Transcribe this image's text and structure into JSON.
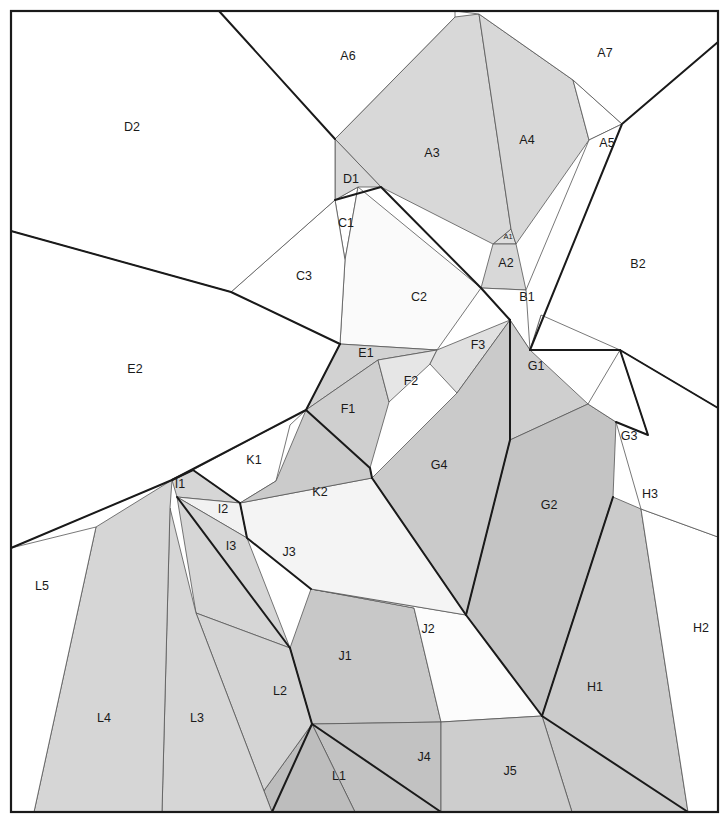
{
  "figure": {
    "kind": "polygon-region-map",
    "width": 728,
    "height": 834,
    "frame": {
      "x": 11,
      "y": 11,
      "width": 707,
      "height": 801
    },
    "background_color": "#ffffff",
    "label_color": "#1a1a1a"
  },
  "palette": {
    "white": "#ffffff",
    "near_white": "#fafafa",
    "very_light": "#f2f2f2",
    "light": "#e3e3e3",
    "light_mid": "#dadada",
    "mid": "#cfcfcf",
    "mid_dark": "#c4c4c4",
    "dark": "#bcbcbc",
    "darker": "#b4b4b4",
    "thin_stroke": "#555555",
    "thick_stroke": "#1a1a1a"
  },
  "strokes": {
    "thin_width": 0.8,
    "thick_width": 2.0
  },
  "regions": [
    {
      "id": "A1",
      "label": "A1",
      "label_x": 508,
      "label_y": 237,
      "tiny": true,
      "fill": "#dedede",
      "stroke": "#555555",
      "stroke_width": 0.8,
      "points": "493,244 511,229 516,244"
    },
    {
      "id": "A2",
      "label": "A2",
      "label_x": 506,
      "label_y": 264,
      "tiny": false,
      "fill": "#d8d8d8",
      "stroke": "#555555",
      "stroke_width": 0.8,
      "points": "493,244 516,244 526,290 481,288"
    },
    {
      "id": "A3",
      "label": "A3",
      "label_x": 432,
      "label_y": 154,
      "tiny": false,
      "fill": "#d8d8d8",
      "stroke": "#555555",
      "stroke_width": 0.8,
      "points": "335,139 455,17 479,14 511,229 493,244 381,187"
    },
    {
      "id": "A4",
      "label": "A4",
      "label_x": 527,
      "label_y": 141,
      "tiny": false,
      "fill": "#d8d8d8",
      "stroke": "#555555",
      "stroke_width": 0.8,
      "points": "479,14 573,80 589,140 516,244 511,229"
    },
    {
      "id": "A5",
      "label": "A5",
      "label_x": 607,
      "label_y": 144,
      "tiny": false,
      "fill": "#ffffff",
      "stroke": "#555555",
      "stroke_width": 0.8,
      "points": "573,80 622,124 589,140"
    },
    {
      "id": "A6",
      "label": "A6",
      "label_x": 348,
      "label_y": 57,
      "tiny": false,
      "fill": "#ffffff",
      "stroke": "#555555",
      "stroke_width": 0.8,
      "points": "219,11 455,11 455,17 335,139"
    },
    {
      "id": "A7",
      "label": "A7",
      "label_x": 605,
      "label_y": 54,
      "tiny": false,
      "fill": "#ffffff",
      "stroke": "#555555",
      "stroke_width": 0.8,
      "points": "455,11 718,11 718,42 622,124 573,80 479,14"
    },
    {
      "id": "B1",
      "label": "B1",
      "label_x": 527,
      "label_y": 298,
      "tiny": false,
      "fill": "#ffffff",
      "stroke": "#555555",
      "stroke_width": 0.8,
      "points": "526,290 481,288 510,320 530,350 541,315"
    },
    {
      "id": "B2",
      "label": "B2",
      "label_x": 638,
      "label_y": 265,
      "tiny": false,
      "fill": "#ffffff",
      "stroke": "#555555",
      "stroke_width": 0.8,
      "points": "718,42 718,408 620,350 541,315 530,350 526,290 589,140 622,124"
    },
    {
      "id": "C1",
      "label": "C1",
      "label_x": 346,
      "label_y": 224,
      "tiny": false,
      "fill": "#ffffff",
      "stroke": "#555555",
      "stroke_width": 0.8,
      "points": "335,200 358,187 345,260"
    },
    {
      "id": "C2",
      "label": "C2",
      "label_x": 419,
      "label_y": 298,
      "tiny": false,
      "fill": "#fafafa",
      "stroke": "#555555",
      "stroke_width": 0.8,
      "points": "358,187 481,288 437,350 340,344 345,260"
    },
    {
      "id": "C3",
      "label": "C3",
      "label_x": 304,
      "label_y": 277,
      "tiny": false,
      "fill": "#ffffff",
      "stroke": "#555555",
      "stroke_width": 0.8,
      "points": "335,200 345,260 340,344 231,292"
    },
    {
      "id": "D1",
      "label": "D1",
      "label_x": 351,
      "label_y": 180,
      "tiny": false,
      "fill": "#d8d8d8",
      "stroke": "#555555",
      "stroke_width": 0.8,
      "points": "335,139 381,187 358,187 335,200"
    },
    {
      "id": "D2",
      "label": "D2",
      "label_x": 132,
      "label_y": 128,
      "tiny": false,
      "fill": "#ffffff",
      "stroke": "#555555",
      "stroke_width": 0.8,
      "points": "11,11 219,11 335,139 335,200 231,292 11,231"
    },
    {
      "id": "E1",
      "label": "E1",
      "label_x": 366,
      "label_y": 354,
      "tiny": false,
      "fill": "#d2d2d2",
      "stroke": "#555555",
      "stroke_width": 0.8,
      "points": "340,344 437,350 378,360 306,410"
    },
    {
      "id": "E2",
      "label": "E2",
      "label_x": 135,
      "label_y": 370,
      "tiny": false,
      "fill": "#ffffff",
      "stroke": "#555555",
      "stroke_width": 0.8,
      "points": "11,231 231,292 340,344 306,410 172,480 11,548"
    },
    {
      "id": "F1",
      "label": "F1",
      "label_x": 348,
      "label_y": 410,
      "tiny": false,
      "fill": "#cfcfcf",
      "stroke": "#555555",
      "stroke_width": 0.8,
      "points": "306,410 378,360 389,402 370,468"
    },
    {
      "id": "F2",
      "label": "F2",
      "label_x": 411,
      "label_y": 382,
      "tiny": false,
      "fill": "#e6e6e6",
      "stroke": "#555555",
      "stroke_width": 0.8,
      "points": "378,360 437,350 430,364 389,402"
    },
    {
      "id": "F3",
      "label": "F3",
      "label_x": 478,
      "label_y": 346,
      "tiny": false,
      "fill": "#e0e0e0",
      "stroke": "#555555",
      "stroke_width": 0.8,
      "points": "437,350 510,320 457,393 430,364"
    },
    {
      "id": "G1",
      "label": "G1",
      "label_x": 536,
      "label_y": 367,
      "tiny": false,
      "fill": "#cfcfcf",
      "stroke": "#555555",
      "stroke_width": 0.8,
      "points": "510,320 530,350 588,404 510,440"
    },
    {
      "id": "G2",
      "label": "G2",
      "label_x": 549,
      "label_y": 506,
      "tiny": false,
      "fill": "#c4c4c4",
      "stroke": "#555555",
      "stroke_width": 0.8,
      "points": "510,440 588,404 616,422 613,497 542,716 466,615"
    },
    {
      "id": "G3",
      "label": "G3",
      "label_x": 629,
      "label_y": 437,
      "tiny": false,
      "fill": "#ffffff",
      "stroke": "#555555",
      "stroke_width": 0.8,
      "points": "588,404 620,350 648,435 616,422"
    },
    {
      "id": "G4",
      "label": "G4",
      "label_x": 439,
      "label_y": 466,
      "tiny": false,
      "fill": "#cacaca",
      "stroke": "#555555",
      "stroke_width": 0.8,
      "points": "457,393 510,320 510,440 466,615 372,478"
    },
    {
      "id": "H1",
      "label": "H1",
      "label_x": 595,
      "label_y": 688,
      "tiny": false,
      "fill": "#cbcbcb",
      "stroke": "#555555",
      "stroke_width": 0.8,
      "points": "613,497 641,509 688,812 572,812 542,716"
    },
    {
      "id": "H2",
      "label": "H2",
      "label_x": 701,
      "label_y": 629,
      "tiny": false,
      "fill": "#ffffff",
      "stroke": "#555555",
      "stroke_width": 0.8,
      "points": "641,509 718,537 718,812 688,812"
    },
    {
      "id": "H3",
      "label": "H3",
      "label_x": 650,
      "label_y": 495,
      "tiny": false,
      "fill": "#ffffff",
      "stroke": "#555555",
      "stroke_width": 0.8,
      "points": "620,350 718,408 718,537 641,509 616,422 648,435"
    },
    {
      "id": "I1",
      "label": "I1",
      "label_x": 180,
      "label_y": 485,
      "tiny": false,
      "fill": "#d6d6d6",
      "stroke": "#555555",
      "stroke_width": 0.8,
      "points": "172,480 193,470 240,503 177,497"
    },
    {
      "id": "I2",
      "label": "I2",
      "label_x": 223,
      "label_y": 510,
      "tiny": false,
      "fill": "#f2f2f2",
      "stroke": "#555555",
      "stroke_width": 0.8,
      "points": "177,497 240,503 247,538"
    },
    {
      "id": "I3",
      "label": "I3",
      "label_x": 231,
      "label_y": 547,
      "tiny": false,
      "fill": "#d6d6d6",
      "stroke": "#555555",
      "stroke_width": 0.8,
      "points": "177,497 247,538 290,648 196,613"
    },
    {
      "id": "J1",
      "label": "J1",
      "label_x": 345,
      "label_y": 657,
      "tiny": false,
      "fill": "#c8c8c8",
      "stroke": "#555555",
      "stroke_width": 0.8,
      "points": "290,648 311,589 414,608 441,722 312,724"
    },
    {
      "id": "J2",
      "label": "J2",
      "label_x": 428,
      "label_y": 630,
      "tiny": false,
      "fill": "#fcfcfc",
      "stroke": "#555555",
      "stroke_width": 0.8,
      "points": "311,589 466,615 542,716 441,722 414,608"
    },
    {
      "id": "J3",
      "label": "J3",
      "label_x": 289,
      "label_y": 553,
      "tiny": false,
      "fill": "#f4f4f4",
      "stroke": "#555555",
      "stroke_width": 0.8,
      "points": "240,503 372,478 466,615 311,589 247,538"
    },
    {
      "id": "J4",
      "label": "J4",
      "label_x": 424,
      "label_y": 758,
      "tiny": false,
      "fill": "#c2c2c2",
      "stroke": "#555555",
      "stroke_width": 0.8,
      "points": "312,724 441,722 441,812 355,812"
    },
    {
      "id": "J5",
      "label": "J5",
      "label_x": 510,
      "label_y": 772,
      "tiny": false,
      "fill": "#cdcdcd",
      "stroke": "#555555",
      "stroke_width": 0.8,
      "points": "441,722 542,716 572,812 441,812"
    },
    {
      "id": "K1",
      "label": "K1",
      "label_x": 254,
      "label_y": 461,
      "tiny": false,
      "fill": "#ffffff",
      "stroke": "#555555",
      "stroke_width": 0.8,
      "points": "193,470 306,410 290,425 276,481 240,503"
    },
    {
      "id": "K2",
      "label": "K2",
      "label_x": 320,
      "label_y": 493,
      "tiny": false,
      "fill": "#cbcbcb",
      "stroke": "#555555",
      "stroke_width": 0.8,
      "points": "306,410 370,468 372,478 240,503 276,481"
    },
    {
      "id": "L1",
      "label": "L1",
      "label_x": 339,
      "label_y": 777,
      "tiny": false,
      "fill": "#bdbdbd",
      "stroke": "#555555",
      "stroke_width": 0.8,
      "points": "312,724 355,812 272,812 263,792"
    },
    {
      "id": "L2",
      "label": "L2",
      "label_x": 280,
      "label_y": 692,
      "tiny": false,
      "fill": "#d4d4d4",
      "stroke": "#555555",
      "stroke_width": 0.8,
      "points": "196,613 290,648 312,724 263,792 272,812 272,812"
    },
    {
      "id": "L3",
      "label": "L3",
      "label_x": 197,
      "label_y": 719,
      "tiny": false,
      "fill": "#d6d6d6",
      "stroke": "#555555",
      "stroke_width": 0.8,
      "points": "170,508 196,613 272,812 162,812"
    },
    {
      "id": "L4",
      "label": "L4",
      "label_x": 104,
      "label_y": 719,
      "tiny": false,
      "fill": "#d6d6d6",
      "stroke": "#555555",
      "stroke_width": 0.8,
      "points": "172,480 170,508 162,812 34,812 96,527"
    },
    {
      "id": "L5",
      "label": "L5",
      "label_x": 42,
      "label_y": 587,
      "tiny": false,
      "fill": "#ffffff",
      "stroke": "#555555",
      "stroke_width": 0.8,
      "points": "11,548 96,527 34,812 11,812"
    }
  ],
  "thick_edges": [
    {
      "name": "a6-a3-ridge",
      "points": "219,11 335,139"
    },
    {
      "name": "a3-d1-c2-b1",
      "points": "335,200 381,187 481,288 510,320"
    },
    {
      "name": "a7-b2-right",
      "points": "718,42 622,124 530,350"
    },
    {
      "name": "b1-g1-down",
      "points": "530,350 620,350 718,408"
    },
    {
      "name": "e2-top-ridge",
      "points": "11,231 231,292 340,344"
    },
    {
      "name": "e1-f1-edge",
      "points": "340,344 306,410"
    },
    {
      "name": "f1-k2-edge",
      "points": "306,410 370,468 372,478"
    },
    {
      "name": "k2-j3-edge",
      "points": "372,478 466,615"
    },
    {
      "name": "g4-edge",
      "points": "510,320 510,440 466,615"
    },
    {
      "name": "g2-h1-edge",
      "points": "613,497 542,716"
    },
    {
      "name": "h1-bottom",
      "points": "542,716 688,812"
    },
    {
      "name": "g3-h3-edge",
      "points": "620,350 648,435 616,422"
    },
    {
      "name": "e2-lower",
      "points": "11,548 172,480 306,410"
    },
    {
      "name": "i1-edge",
      "points": "172,480 193,470 240,503"
    },
    {
      "name": "i3-edge",
      "points": "177,497 290,648"
    },
    {
      "name": "i2-j3-edge",
      "points": "240,503 247,538 311,589"
    },
    {
      "name": "j1-l2-edge",
      "points": "290,648 312,724"
    },
    {
      "name": "j1-j4-edge",
      "points": "312,724 441,812"
    },
    {
      "name": "j2-right",
      "points": "466,615 542,716"
    },
    {
      "name": "l1-bottom",
      "points": "272,812 312,724"
    }
  ],
  "meta": {
    "region_count": 42,
    "label_font_size": 12.5
  }
}
